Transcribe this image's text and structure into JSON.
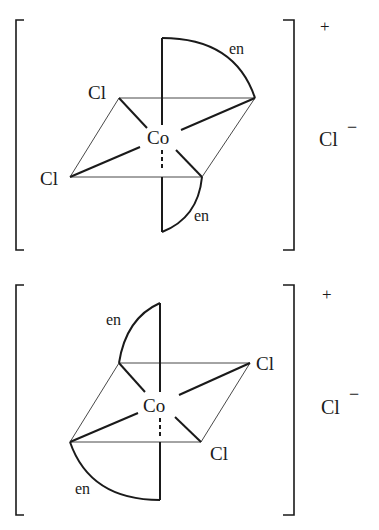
{
  "figure": {
    "complexes": [
      {
        "id": "top",
        "ligand_labels": {
          "en_upper": "en",
          "en_lower": "en",
          "cl_upper": "Cl",
          "cl_lower": "Cl"
        },
        "metal": "Co",
        "charge": "+",
        "counter_ion": {
          "symbol": "Cl",
          "charge": "−"
        }
      },
      {
        "id": "bottom",
        "ligand_labels": {
          "en_upper": "en",
          "en_lower": "en",
          "cl_upper": "Cl",
          "cl_lower": "Cl"
        },
        "metal": "Co",
        "charge": "+",
        "counter_ion": {
          "symbol": "Cl",
          "charge": "−"
        }
      }
    ]
  }
}
